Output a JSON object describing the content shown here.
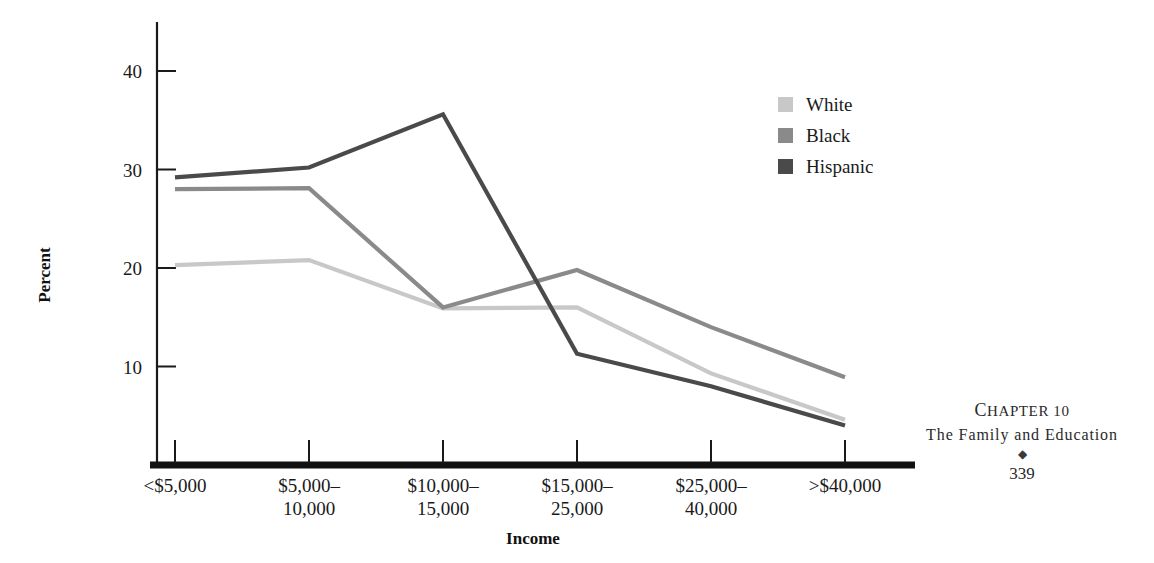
{
  "chart_data": {
    "type": "line",
    "title": "",
    "subtitle": "",
    "xlabel": "Income",
    "ylabel": "Percent",
    "categories": [
      "<$5,000",
      "$5,000–10,000",
      "$10,000–15,000",
      "$15,000–25,000",
      "$25,000–40,000",
      ">$40,000"
    ],
    "category_lines": [
      [
        "<$5,000",
        ""
      ],
      [
        "$5,000–",
        "10,000"
      ],
      [
        "$10,000–",
        "15,000"
      ],
      [
        "$15,000–",
        "25,000"
      ],
      [
        "$25,000–",
        "40,000"
      ],
      [
        ">$40,000",
        ""
      ]
    ],
    "series": [
      {
        "name": "White",
        "color": "#c8c8c8",
        "values": [
          20.3,
          20.8,
          15.9,
          16.0,
          9.3,
          4.6
        ]
      },
      {
        "name": "Black",
        "color": "#8a8a8a",
        "values": [
          28.0,
          28.1,
          16.0,
          19.8,
          14.0,
          8.9
        ]
      },
      {
        "name": "Hispanic",
        "color": "#4a4a4a",
        "values": [
          29.2,
          30.2,
          35.6,
          11.3,
          8.0,
          4.0
        ]
      }
    ],
    "ylim": [
      0,
      44
    ],
    "xlim": [
      0,
      5
    ],
    "yticks": [
      10,
      20,
      30,
      40
    ],
    "ytick_labels": [
      "10",
      "20",
      "30",
      "40"
    ],
    "grid": false,
    "legend_position": "upper right",
    "axis_color": "#1a1a1a",
    "baseline_color": "#111111"
  },
  "legend": {
    "items": [
      {
        "label": "White",
        "color": "#c8c8c8"
      },
      {
        "label": "Black",
        "color": "#8a8a8a"
      },
      {
        "label": "Hispanic",
        "color": "#4a4a4a"
      }
    ]
  },
  "footer": {
    "chapter_label": "Chapter 10",
    "chapter_label_word": "C",
    "chapter_label_rest": "HAPTER",
    "chapter_number": "10",
    "chapter_title": "The Family and Education",
    "ornament": "◆",
    "page_number": "339"
  }
}
